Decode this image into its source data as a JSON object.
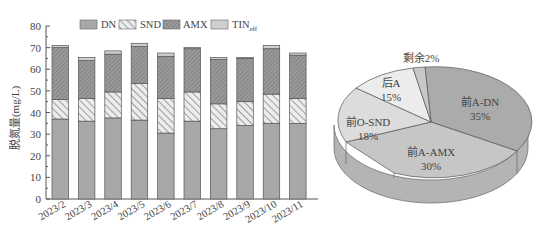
{
  "chart_data": [
    {
      "type": "bar",
      "stacked": true,
      "title": "",
      "xlabel": "",
      "ylabel": "脱氮量(mg/L)",
      "ylim": [
        0,
        80
      ],
      "yticks": [
        0,
        10,
        20,
        30,
        40,
        50,
        60,
        70,
        80
      ],
      "categories": [
        "2023/2",
        "2023/3",
        "2023/4",
        "2023/5",
        "2023/6",
        "2023/7",
        "2023/8",
        "2023/9",
        "2023/10",
        "2023/11"
      ],
      "series": [
        {
          "name": "DN",
          "pattern": "solid",
          "color": "#a8a8a8",
          "values": [
            37,
            36,
            37.5,
            36.5,
            30.5,
            36,
            32.5,
            34,
            35,
            35
          ]
        },
        {
          "name": "SND",
          "pattern": "hatch-backslash",
          "color": "#e0e0e0",
          "values": [
            9,
            10.5,
            12,
            17,
            16,
            13.5,
            11.5,
            11,
            13.5,
            11.5
          ]
        },
        {
          "name": "AMX",
          "pattern": "hatch-slash-dense",
          "color": "#8f8f8f",
          "values": [
            24,
            17.5,
            17.5,
            17,
            19.5,
            20,
            20.5,
            20,
            21,
            20
          ]
        },
        {
          "name": "TINeff",
          "pattern": "solid-light",
          "color": "#cfcfcf",
          "values": [
            1,
            1.5,
            1.5,
            1.5,
            1.5,
            0.5,
            1,
            0.5,
            1.5,
            1
          ]
        }
      ],
      "legend": {
        "position": "top",
        "entries": [
          "DN",
          "SND",
          "AMX",
          "TINeff"
        ]
      },
      "grid": false
    },
    {
      "type": "pie",
      "style": "3d",
      "categories": [
        "前A-DN",
        "前A-AMX",
        "前O-SND",
        "后A",
        "剩余"
      ],
      "values": [
        35,
        30,
        18,
        15,
        2
      ],
      "labels": [
        "前A-DN\n35%",
        "前A-AMX\n30%",
        "前O-SND\n18%",
        "后A\n15%",
        "剩余2%"
      ],
      "colors": [
        "#ababab",
        "#c4c4c4",
        "#dcdcdc",
        "#ececec",
        "#c8c8c8"
      ]
    }
  ],
  "legend": {
    "dn": "DN",
    "snd": "SND",
    "amx": "AMX",
    "tin_main": "TIN",
    "tin_sub": "eff"
  },
  "axis": {
    "ylabel": "脱氮量(mg/L)"
  },
  "pie_labels": {
    "a_dn_name": "前A-DN",
    "a_dn_pct": "35%",
    "a_amx_name": "前A-AMX",
    "a_amx_pct": "30%",
    "o_snd_name": "前O-SND",
    "o_snd_pct": "18%",
    "post_a_name": "后A",
    "post_a_pct": "15%",
    "rest": "剩余2%"
  }
}
